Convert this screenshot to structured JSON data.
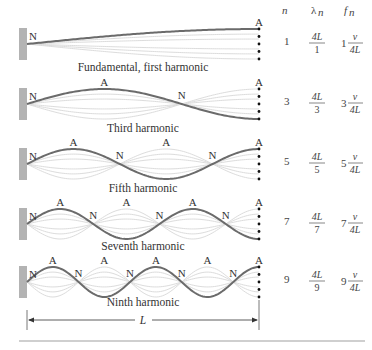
{
  "table_headers": {
    "n": "n",
    "lambda": "λ",
    "lambda_sub": "n",
    "f": "f",
    "f_sub": "n"
  },
  "node_label": "N",
  "antinode_label": "A",
  "length_label": "L",
  "colors": {
    "wall": "#b3b3b3",
    "main_wave": "#6b6b6b",
    "ghost_wave": "#dcdcdc",
    "dot": "#111111",
    "rule": "#cfcfcf"
  },
  "harmonics": [
    {
      "n": "1",
      "caption": "Fundamental, first harmonic",
      "lambda_num": "4L",
      "lambda_den": "1",
      "f_coef": "1",
      "f_num": "v",
      "f_den": "4L"
    },
    {
      "n": "3",
      "caption": "Third harmonic",
      "lambda_num": "4L",
      "lambda_den": "3",
      "f_coef": "3",
      "f_num": "v",
      "f_den": "4L"
    },
    {
      "n": "5",
      "caption": "Fifth harmonic",
      "lambda_num": "4L",
      "lambda_den": "5",
      "f_coef": "5",
      "f_num": "v",
      "f_den": "4L"
    },
    {
      "n": "7",
      "caption": "Seventh harmonic",
      "lambda_num": "4L",
      "lambda_den": "7",
      "f_coef": "7",
      "f_num": "v",
      "f_den": "4L"
    },
    {
      "n": "9",
      "caption": "Ninth harmonic",
      "lambda_num": "4L",
      "lambda_den": "9",
      "f_coef": "9",
      "f_num": "v",
      "f_den": "4L"
    }
  ]
}
